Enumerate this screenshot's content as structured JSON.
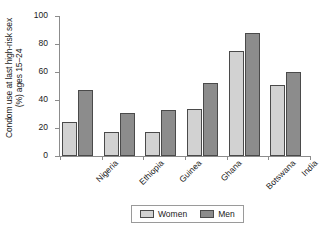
{
  "chart_data": {
    "type": "bar",
    "title": "",
    "subtitle": "",
    "xlabel": "",
    "ylabel": "Condom use at last high-risk sex (%) ages 15–24",
    "ylabel_lines": [
      "Condom use at last high-risk sex",
      "(%) ages 15–24"
    ],
    "categories": [
      "Nigeria",
      "Ethiopia",
      "Guinea",
      "Ghana",
      "Botswana",
      "India"
    ],
    "series": [
      {
        "name": "Women",
        "values": [
          24.5,
          17.5,
          17.5,
          33.5,
          75.0,
          51.0
        ],
        "color": "#d2d2d2"
      },
      {
        "name": "Men",
        "values": [
          47.0,
          31.0,
          33.0,
          52.5,
          88.0,
          60.0
        ],
        "color": "#8c8c8c"
      }
    ],
    "ylim": [
      0,
      100
    ],
    "y_ticks": [
      0,
      20,
      40,
      60,
      80,
      100
    ],
    "y_tick_labels": [
      "0",
      "20",
      "40",
      "60",
      "80",
      "100"
    ],
    "grid": false,
    "legend_position": "bottom-center",
    "axis_color": "#8c8c8c",
    "bar_outline_color": "#4a4a4a"
  },
  "legend": {
    "entries": [
      {
        "label": "Women",
        "color": "#d2d2d2"
      },
      {
        "label": "Men",
        "color": "#8c8c8c"
      }
    ]
  }
}
